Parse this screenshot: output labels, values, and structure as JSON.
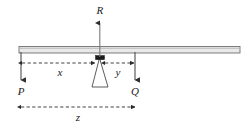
{
  "diagram": {
    "type": "mechanics-free-body-diagram",
    "colors": {
      "beam_fill": "#e8e8e8",
      "beam_stroke": "#6b6b6b",
      "line": "#3a3a3a",
      "dimension_line": "#2b2b2b",
      "text": "#1a1a1a",
      "background": "#ffffff"
    },
    "forces": [
      {
        "id": "force-p",
        "label": "P",
        "direction": "down",
        "location": "beam-left-end"
      },
      {
        "id": "force-q",
        "label": "Q",
        "direction": "down",
        "location": "beam-right-of-fulcrum"
      },
      {
        "id": "force-r",
        "label": "R",
        "direction": "up",
        "location": "fulcrum"
      }
    ],
    "dimensions": [
      {
        "id": "dim-x",
        "label": "x",
        "from": "P",
        "to": "fulcrum",
        "style": "dashed",
        "placement": "upper"
      },
      {
        "id": "dim-y",
        "label": "y",
        "from": "fulcrum",
        "to": "Q",
        "style": "dashed",
        "placement": "upper"
      },
      {
        "id": "dim-z",
        "label": "z",
        "from": "P",
        "to": "Q",
        "style": "dashed",
        "placement": "lower"
      }
    ],
    "parts": [
      {
        "id": "beam",
        "name": "horizontal beam"
      },
      {
        "id": "fulcrum",
        "name": "triangular fulcrum support"
      },
      {
        "id": "pivot-block",
        "name": "pivot contact block"
      }
    ]
  }
}
